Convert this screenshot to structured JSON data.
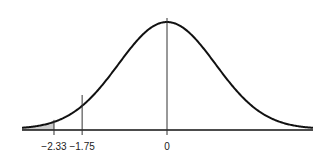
{
  "chart_data": {
    "type": "area",
    "title": "",
    "xlabel": "",
    "ylabel": "",
    "distribution": {
      "mean": 0,
      "sd": 1
    },
    "xlim": [
      -3.0,
      3.0
    ],
    "grid": false,
    "legend": null,
    "vertical_lines": [
      {
        "x": -2.33,
        "label": "−2.33"
      },
      {
        "x": -1.75,
        "label": "−1.75"
      },
      {
        "x": 0,
        "label": "0"
      }
    ],
    "shaded_region": {
      "from": -3.0,
      "to": -2.33,
      "color": "#cccccc"
    },
    "tick_labels": [
      "−2.33",
      "−1.75",
      "0"
    ],
    "curve_color": "#111111",
    "axis_color": "#111111"
  }
}
